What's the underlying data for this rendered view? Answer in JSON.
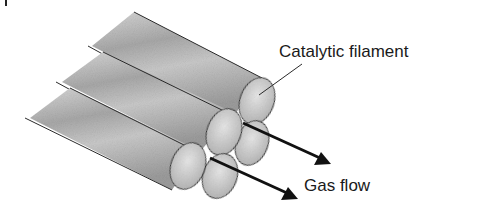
{
  "figure": {
    "labels": {
      "filament": "Catalytic filament",
      "flow": "Gas flow"
    },
    "colors": {
      "outline": "#2a2a2a",
      "fill_dark": "#9a9a9a",
      "fill_light": "#e4e4e4",
      "arrow": "#111111",
      "text": "#1a1a1a"
    }
  }
}
